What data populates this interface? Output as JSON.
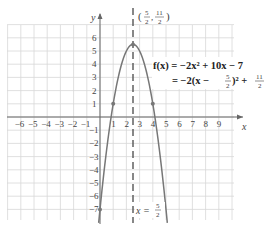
{
  "chart_data": {
    "type": "line",
    "title": "",
    "xlabel": "x",
    "ylabel": "y",
    "xlim": [
      -7,
      10
    ],
    "ylim": [
      -8,
      7
    ],
    "grid": true,
    "x_ticks": [
      "-6",
      "-5",
      "-4",
      "-3",
      "-2",
      "-1",
      "1",
      "2",
      "3",
      "4",
      "5",
      "6",
      "7",
      "8",
      "9"
    ],
    "y_ticks": [
      "6",
      "5",
      "4",
      "3",
      "2",
      "1",
      "-1",
      "-2",
      "-3",
      "-4",
      "-5",
      "-6",
      "-7"
    ],
    "series": [
      {
        "name": "f(x) = -2x^2 + 10x - 7",
        "function": "-2*x^2 + 10*x - 7",
        "x": [
          -0.05,
          0,
          0.5,
          1,
          1.5,
          2,
          2.5,
          3,
          3.5,
          4,
          4.5,
          5,
          5.05
        ],
        "y": [
          -7.51,
          -7,
          -2.5,
          1,
          3.5,
          5,
          5.5,
          5,
          3.5,
          1,
          -2.5,
          -7,
          -7.51
        ]
      }
    ],
    "marked_points": [
      {
        "x": 0,
        "y": -7
      },
      {
        "x": 1,
        "y": 1
      },
      {
        "x": 2.5,
        "y": 5.5,
        "label": "(5/2, 11/2)"
      },
      {
        "x": 4,
        "y": 1
      }
    ],
    "axis_of_symmetry": {
      "x": 2.5,
      "label": "x = 5/2",
      "style": "dashed"
    },
    "annotations": [
      "f(x) = −2x² + 10x − 7",
      "= −2(x − 5/2)² + 11/2"
    ]
  },
  "labels": {
    "x_axis": "x",
    "y_axis": "y",
    "vertex_open": "(",
    "vertex_close": ")",
    "vertex_x_num": "5",
    "vertex_x_den": "2",
    "vertex_y_num": "11",
    "vertex_y_den": "2",
    "eq_line1": "f(x) = −2x² + 10x − 7",
    "eq_line2_a": "= −2(x − ",
    "eq_line2_frac1_num": "5",
    "eq_line2_frac1_den": "2",
    "eq_line2_b": ")² + ",
    "eq_line2_frac2_num": "11",
    "eq_line2_frac2_den": "2",
    "sym_prefix": "x = ",
    "sym_num": "5",
    "sym_den": "2"
  }
}
